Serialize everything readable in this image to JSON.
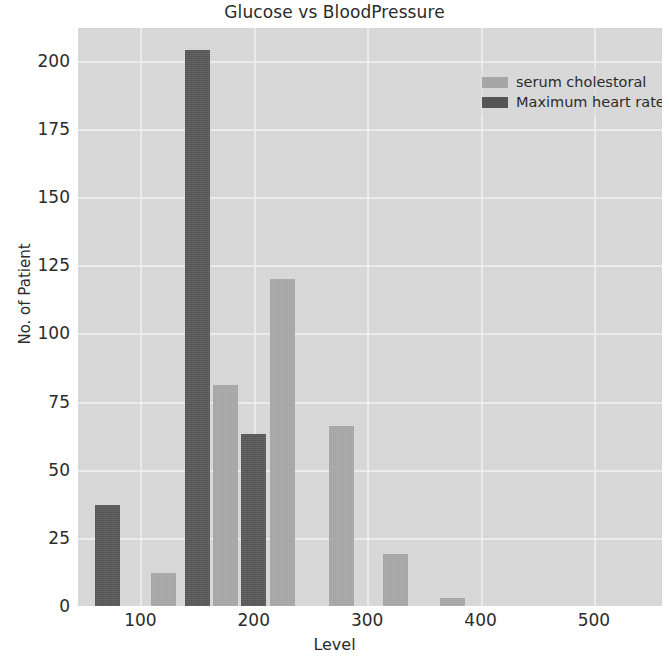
{
  "chart_data": {
    "type": "bar",
    "title": "Glucose vs BloodPressure",
    "xlabel": "Level",
    "ylabel": "No. of Patient",
    "xlim": [
      45,
      560
    ],
    "ylim": [
      0,
      212
    ],
    "grid": true,
    "legend_position": "top-right",
    "xticks": [
      "100",
      "200",
      "300",
      "400",
      "500"
    ],
    "xtick_values": [
      100,
      200,
      300,
      400,
      500
    ],
    "yticks": [
      "0",
      "25",
      "50",
      "75",
      "100",
      "125",
      "150",
      "175",
      "200"
    ],
    "ytick_values": [
      0,
      25,
      50,
      75,
      100,
      125,
      150,
      175,
      200
    ],
    "series": [
      {
        "name": "serum cholestoral",
        "color": "#a6a6a6",
        "points": [
          {
            "x": 120,
            "y": 12
          },
          {
            "x": 175,
            "y": 81
          },
          {
            "x": 225,
            "y": 120
          },
          {
            "x": 277,
            "y": 66
          },
          {
            "x": 325,
            "y": 19
          },
          {
            "x": 375,
            "y": 3
          }
        ]
      },
      {
        "name": "Maximum heart rate achieved",
        "color": "#555555",
        "points": [
          {
            "x": 71,
            "y": 37
          },
          {
            "x": 150,
            "y": 204
          },
          {
            "x": 200,
            "y": 63
          }
        ]
      }
    ]
  },
  "legend": {
    "items": [
      {
        "label": "serum cholestoral",
        "series": 0
      },
      {
        "label": "Maximum heart rate achieved",
        "series": 1
      }
    ]
  },
  "colors": {
    "plot_background": "#d8d8d8",
    "gridline": "#f0f0f0",
    "series_0": "#a6a6a6",
    "series_1": "#555555",
    "text": "#2b2b2b"
  }
}
